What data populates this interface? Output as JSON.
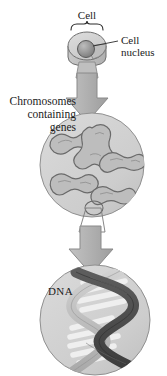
{
  "diagram": {
    "type": "biological-illustration",
    "background_color": "#ffffff",
    "labels": {
      "cell": "Cell",
      "nucleus_line1": "Cell",
      "nucleus_line2": "nucleus",
      "chromosomes_line1": "Chromosomes",
      "chromosomes_line2": "containing",
      "chromosomes_line3": "genes",
      "dna": "DNA"
    },
    "colors": {
      "text": "#1b1b1b",
      "cell_body": "#c9c9c9",
      "cell_body_light": "#d8d8d8",
      "cell_outline": "#6f6f6f",
      "nucleus_fill": "#9a9a9a",
      "nucleus_outline": "#5a5a5a",
      "arrow_fill": "#b4b4b4",
      "arrow_outline": "#8a8a8a",
      "circle_fill": "#cfcfcf",
      "circle_outline": "#909090",
      "chromosome_fill": "#bdbdbd",
      "chromosome_outline": "#6a6a6a",
      "helix_dark": "#4a4a4a",
      "helix_light": "#c4c4c4",
      "rung_fill": "#f2f2f2",
      "leader_line": "#2b2b2b"
    },
    "structures": [
      {
        "name": "cell",
        "stage": 1,
        "shape": "3d-disc-with-nucleus"
      },
      {
        "name": "nucleus-circle",
        "stage": 2,
        "shape": "circle-with-chromosomes",
        "chromosome_count": 4
      },
      {
        "name": "dna-circle",
        "stage": 3,
        "shape": "circle-with-double-helix"
      }
    ],
    "arrows": [
      {
        "name": "arrow-cell-to-chromosomes",
        "direction": "down"
      },
      {
        "name": "arrow-chromosomes-to-dna",
        "direction": "down"
      }
    ]
  }
}
